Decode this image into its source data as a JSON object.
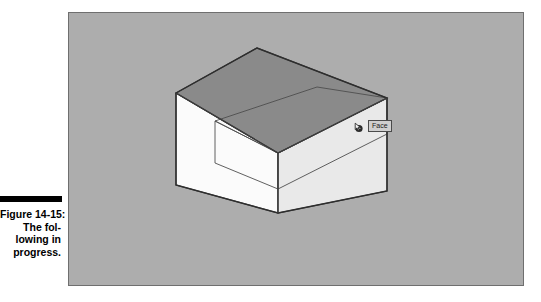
{
  "figure": {
    "caption_rule": "",
    "caption_lines": [
      "Figure 14-15:",
      "The fol-",
      "lowing in",
      "progress."
    ],
    "caption_full": "Figure 14-15: The following in progress."
  },
  "canvas": {
    "background_color": "#adadad",
    "border_color": "#6f6f6f",
    "width": 456,
    "height": 274
  },
  "model": {
    "description": "3D rectangular box in axonometric view with a push-pull preview notch on the upper right face",
    "faces": {
      "top_label": "top-face",
      "top_color": "#8a8a8a",
      "left_label": "left-face",
      "left_color": "#fbfbfb",
      "right_label": "right-face",
      "right_color": "#e8e8e8",
      "notch_top_color": "#d8d8d8",
      "notch_front_color": "#e2e2e2",
      "edge_color": "#3b3b3b"
    }
  },
  "tooltip": {
    "label": "Face",
    "cursor_icon": "pushpull-cursor-icon",
    "background_color": "#cfcfcf",
    "border_color": "#4a4a4a"
  }
}
